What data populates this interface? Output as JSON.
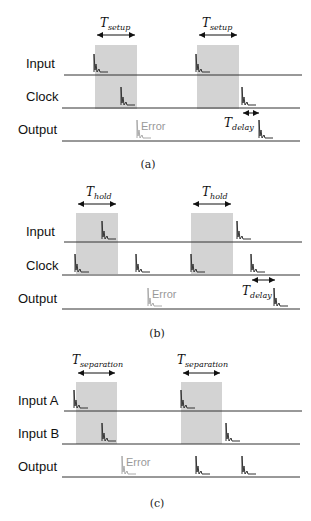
{
  "panels": [
    {
      "caption": "(a)",
      "rows": [
        "Input",
        "Clock",
        "Output"
      ],
      "window_label": {
        "T": "T",
        "sub": "setup"
      },
      "delay_label": {
        "T": "T",
        "sub": "delay"
      },
      "error_label": "Error"
    },
    {
      "caption": "(b)",
      "rows": [
        "Input",
        "Clock",
        "Output"
      ],
      "window_label": {
        "T": "T",
        "sub": "hold"
      },
      "delay_label": {
        "T": "T",
        "sub": "delay"
      },
      "error_label": "Error"
    },
    {
      "caption": "(c)",
      "rows": [
        "Input A",
        "Input B",
        "Output"
      ],
      "window_label": {
        "T": "T",
        "sub": "separation"
      },
      "error_label": "Error"
    }
  ],
  "colors": {
    "window": "#d3d3d3",
    "line": "#333333",
    "spike": "#333333",
    "error": "#999999"
  }
}
